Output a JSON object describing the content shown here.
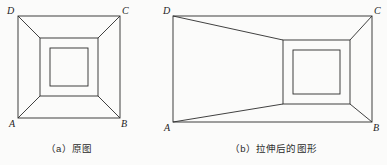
{
  "page": {
    "background_color": "#fbfbfa",
    "stroke_color": "#2b2b2b",
    "width": 387,
    "height": 165
  },
  "figures": [
    {
      "id": "original",
      "caption": "（a）原图",
      "caption_index": "（a）",
      "caption_text": "原图",
      "vertices": {
        "D": "D",
        "C": "C",
        "A": "A",
        "B": "B"
      },
      "shape_note": "三个同心正方形，四条对角线连接外框角点与中框角点",
      "geometry": {
        "outer": {
          "x1": 18,
          "y1": 16,
          "x2": 120,
          "y2": 118
        },
        "middle": {
          "x1": 40,
          "y1": 38,
          "x2": 98,
          "y2": 96
        },
        "inner": {
          "x1": 50,
          "y1": 48,
          "x2": 88,
          "y2": 86
        }
      }
    },
    {
      "id": "stretched",
      "caption": "（b）拉伸后的图形",
      "caption_index": "（b）",
      "caption_text": "拉伸后的图形",
      "vertices": {
        "D": "D",
        "C": "C",
        "A": "A",
        "B": "B"
      },
      "shape_note": "外框水平拉伸为长方形，内部方框保持正方形并靠右",
      "geometry": {
        "outer": {
          "x1": 13,
          "y1": 16,
          "x2": 212,
          "y2": 122
        },
        "middle": {
          "x1": 123,
          "y1": 40,
          "x2": 190,
          "y2": 104
        },
        "inner": {
          "x1": 133,
          "y1": 50,
          "x2": 180,
          "y2": 94
        }
      }
    }
  ]
}
